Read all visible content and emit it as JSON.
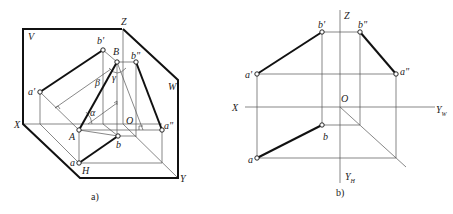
{
  "figure_a": {
    "caption": "a)",
    "plane_labels": {
      "V": "V",
      "W": "W",
      "H": "H"
    },
    "axis_labels": {
      "X": "X",
      "Y": "Y",
      "Z": "Z",
      "O": "O"
    },
    "point_labels": {
      "a_prime": "a'",
      "b_prime": "b'",
      "B": "B",
      "b_dprime": "b\"",
      "A": "A",
      "a_dprime": "a\"",
      "a": "a",
      "b": "b"
    },
    "angle_labels": {
      "alpha": "α",
      "beta": "β",
      "gamma": "γ"
    }
  },
  "figure_b": {
    "caption": "b)",
    "axis_labels": {
      "X": "X",
      "Z": "Z",
      "O": "O",
      "Yw": "Y",
      "Yw_sub": "W",
      "Yh": "Y",
      "Yh_sub": "H"
    },
    "point_labels": {
      "a_prime": "a'",
      "b_prime": "b'",
      "b_dprime": "b\"",
      "a_dprime": "a\"",
      "a": "a",
      "b": "b"
    }
  }
}
